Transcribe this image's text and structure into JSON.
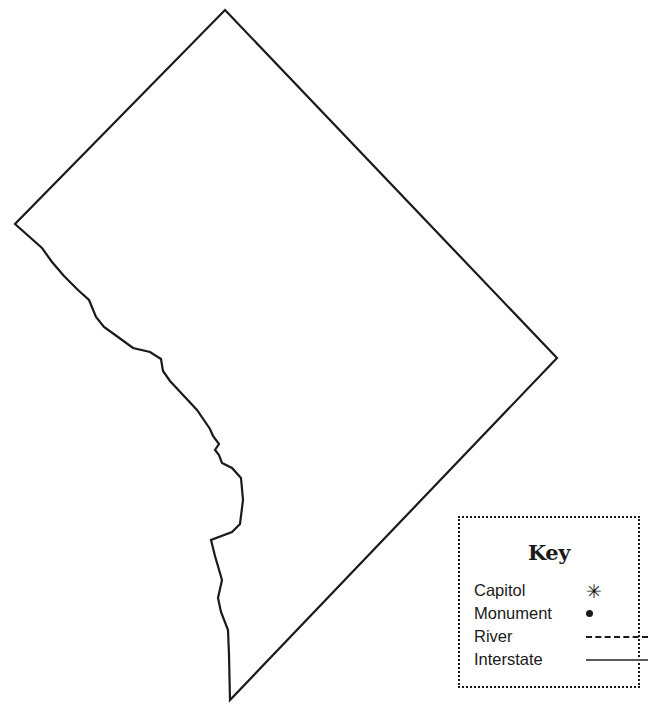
{
  "map": {
    "title": "Washington, D.C. outline map",
    "outline_color": "#1a1a1a",
    "fill_color": "#ffffff",
    "background_color": "#ffffff",
    "stroke_width": 2.2
  },
  "legend": {
    "title": "Key",
    "border_style": "dotted",
    "border_color": "#1a1a1a",
    "rows": [
      {
        "label": "Capitol",
        "symbol": "asterisk-symbol",
        "glyph": "✳"
      },
      {
        "label": "Monument",
        "symbol": "filled-dot-symbol",
        "glyph": "•"
      },
      {
        "label": "River",
        "symbol": "dashed-line-symbol",
        "glyph": ""
      },
      {
        "label": "Interstate",
        "symbol": "solid-line-symbol",
        "glyph": ""
      }
    ]
  }
}
